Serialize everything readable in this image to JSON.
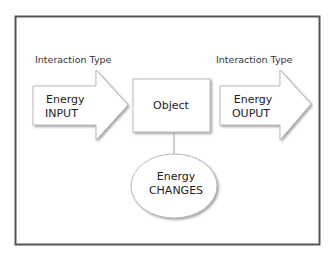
{
  "diagram": {
    "left_label": "Interaction Type",
    "right_label": "Interaction Type",
    "input_arrow": {
      "line1": "Energy",
      "line2": "INPUT"
    },
    "object_box": {
      "label": "Object"
    },
    "output_arrow": {
      "line1": "Energy",
      "line2": "OUPUT"
    },
    "changes_ellipse": {
      "line1": "Energy",
      "line2": "CHANGES"
    },
    "colors": {
      "frame": "#555555",
      "shape_fill": "#ffffff",
      "shape_stroke": "#bdbdbd",
      "shadow": "#9a9a9a",
      "text": "#222222"
    }
  }
}
